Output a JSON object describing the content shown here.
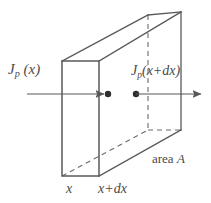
{
  "figure": {
    "background_color": "#ffffff",
    "line_color": "#595959",
    "dashed_line_color": "#6b6b6b",
    "text_color": "#4a4a4a",
    "labels": {
      "flux_in": {
        "symbol": "J",
        "subscript": "p",
        "argument": "(x)",
        "full_text": "Jp (x)"
      },
      "flux_out": {
        "symbol": "J",
        "subscript": "p",
        "argument": "(x+dx)",
        "full_text": "Jp(x+dx)"
      },
      "left_position": "x",
      "right_position": "x+dx",
      "area": {
        "prefix": "area",
        "symbol": "A",
        "full_text": "area A"
      }
    },
    "geometry": {
      "front_face": {
        "left_x": 62,
        "right_x": 99,
        "top_y": 61,
        "bottom_y": 176
      },
      "back_face": {
        "left_x": 148,
        "right_x": 181,
        "top_y": 15,
        "bottom_y": 130
      },
      "arrow_y": 94,
      "in_arrow": {
        "start_x": 27,
        "end_x": 104
      },
      "out_arrow": {
        "start_x": 136,
        "end_x": 201
      },
      "dot_left_x": 108,
      "dot_right_x": 136,
      "dot_radius": 3.2
    }
  }
}
